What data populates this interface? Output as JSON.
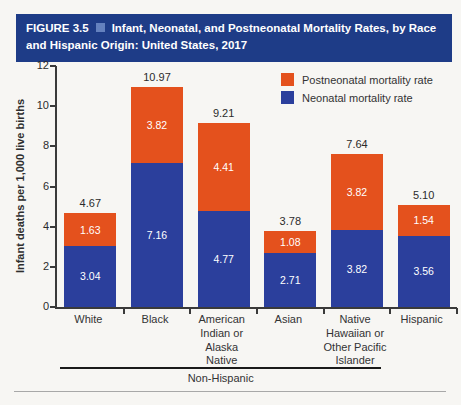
{
  "header": {
    "figure_label": "FIGURE 3.5",
    "title": "Infant, Neonatal, and Postneonatal Mortality Rates, by Race and Hispanic Origin: United States, 2017"
  },
  "legend": {
    "items": [
      {
        "label": "Postneonatal mortality rate",
        "color": "#e4511d"
      },
      {
        "label": "Neonatal mortality rate",
        "color": "#2b3f9c"
      }
    ]
  },
  "colors": {
    "banner_bg": "#1e3c87",
    "banner_square": "#6481be",
    "neonatal": "#2b3f9c",
    "postneonatal": "#e4511d"
  },
  "chart_data": {
    "type": "bar",
    "stacked": true,
    "title": "Infant, Neonatal, and Postneonatal Mortality Rates, by Race and Hispanic Origin: United States, 2017",
    "categories": [
      "White",
      "Black",
      "American Indian or Alaska Native",
      "Asian",
      "Native Hawaiian or Other Pacific Islander",
      "Hispanic"
    ],
    "series": [
      {
        "name": "Neonatal mortality rate",
        "color": "#2b3f9c",
        "values": [
          3.04,
          7.16,
          4.77,
          2.71,
          3.82,
          3.56
        ]
      },
      {
        "name": "Postneonatal mortality rate",
        "color": "#e4511d",
        "values": [
          1.63,
          3.82,
          4.41,
          1.08,
          3.82,
          1.54
        ]
      }
    ],
    "totals": [
      4.67,
      10.97,
      9.21,
      3.78,
      7.64,
      5.1
    ],
    "xlabel": "",
    "ylabel": "Infant deaths per 1,000 live births",
    "ylim": [
      0,
      12
    ],
    "yticks": [
      0,
      2,
      4,
      6,
      8,
      10,
      12
    ],
    "grid": false,
    "legend_position": "upper right",
    "group_label": {
      "text": "Non-Hispanic",
      "applies_to_first_n_categories": 5
    }
  }
}
